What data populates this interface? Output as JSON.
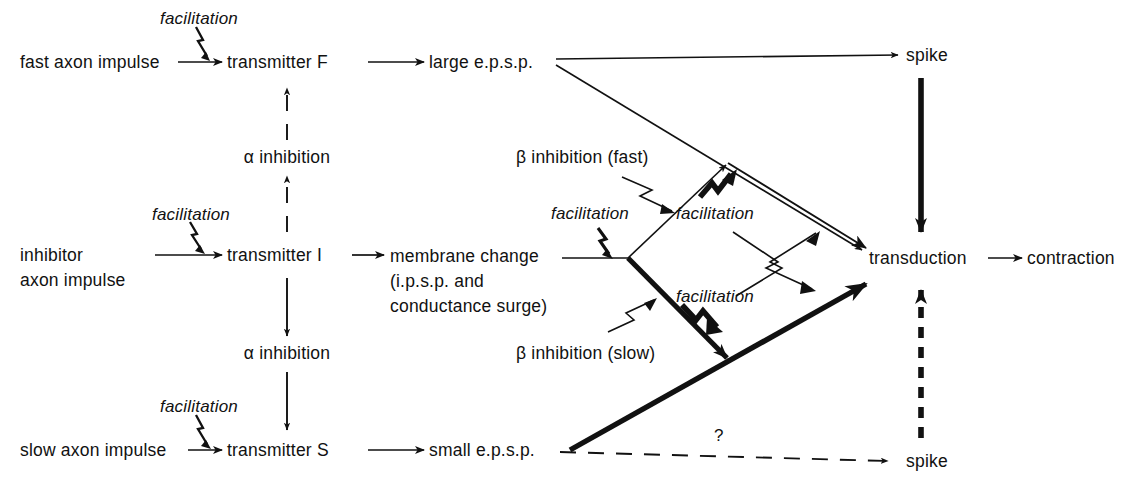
{
  "diagram": {
    "nodes": {
      "fast_axon": "fast axon impulse",
      "transmitter_f": "transmitter F",
      "large_epsp": "large e.p.s.p.",
      "spike_top": "spike",
      "inhibitor_axon_l1": "inhibitor",
      "inhibitor_axon_l2": "axon impulse",
      "transmitter_i": "transmitter I",
      "membrane_l1": "membrane change",
      "membrane_l2": "(i.p.s.p. and",
      "membrane_l3": "conductance surge)",
      "transduction": "transduction",
      "contraction": "contraction",
      "slow_axon": "slow axon impulse",
      "transmitter_s": "transmitter S",
      "small_epsp": "small e.p.s.p.",
      "spike_bottom": "spike"
    },
    "modulators": {
      "facilitation_fast": "facilitation",
      "facilitation_inhibitor": "facilitation",
      "facilitation_slow": "facilitation",
      "facilitation_beta_fast": "facilitation",
      "facilitation_upper_cross": "facilitation",
      "facilitation_lower_cross": "facilitation",
      "alpha_inhibition_upper": "α inhibition",
      "alpha_inhibition_lower": "α inhibition",
      "beta_inhibition_fast": "β inhibition (fast)",
      "beta_inhibition_slow": "β inhibition (slow)",
      "unknown_marker": "?"
    },
    "colors": {
      "ink": "#111111",
      "background": "#ffffff"
    }
  }
}
